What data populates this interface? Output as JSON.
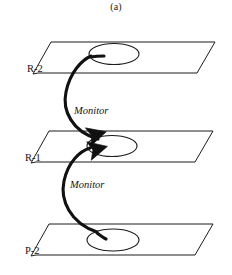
{
  "figure": {
    "caption": "(a)",
    "type": "layered-plane-diagram",
    "background_color": "#ffffff",
    "line_color": "#111111"
  },
  "planes": [
    {
      "id": "plane-r2",
      "label": "R-2",
      "label_x": 27,
      "label_y": 72,
      "points": "38,73 33,74 51,42 215,42 197,73",
      "node": {
        "cx": 114,
        "cy": 54,
        "rx": 25,
        "ry": 10.5
      }
    },
    {
      "id": "plane-r1",
      "label": "R-1",
      "label_x": 25,
      "label_y": 161,
      "points": "36,162 31,163 49,131 213,131 195,162",
      "node": {
        "cx": 112,
        "cy": 146,
        "rx": 25,
        "ry": 10.5
      }
    },
    {
      "id": "plane-p2",
      "label": "P-2",
      "label_x": 25,
      "label_y": 254,
      "points": "36,255 31,256 49,224 213,224 195,255",
      "node": {
        "cx": 113,
        "cy": 240,
        "rx": 26,
        "ry": 11
      }
    }
  ],
  "edges": [
    {
      "id": "edge-monitor-upper",
      "label": "Monitor",
      "label_x": 74,
      "label_y": 114,
      "from": "R-1",
      "to": "R-2",
      "path": "M 98,139 C 72,132 62,110 66,92 C 70,72 82,60 91,56",
      "arrow": {
        "x": 91,
        "y": 56,
        "angle": -22
      }
    },
    {
      "id": "edge-monitor-lower",
      "label": "Monitor",
      "label_x": 70,
      "label_y": 188,
      "from": "P-2",
      "to": "R-1",
      "path": "M 97,232 C 70,223 60,200 64,181 C 68,162 80,151 90,148",
      "arrow": {
        "x": 90,
        "y": 148,
        "angle": -20
      }
    }
  ],
  "arrowheads": [
    {
      "id": "arrowhead-upper-into-r1",
      "x": 90,
      "y": 138,
      "angle": -16
    },
    {
      "id": "arrowhead-lower-into-r1",
      "x": 89,
      "y": 151,
      "angle": -14
    }
  ],
  "tails": [
    {
      "id": "tail-r2-node",
      "path": "M 91,57 C 96,56 101,56 104,56"
    },
    {
      "id": "tail-p2-node",
      "path": "M 97,233 C 101,236 104,238 106,239"
    }
  ]
}
